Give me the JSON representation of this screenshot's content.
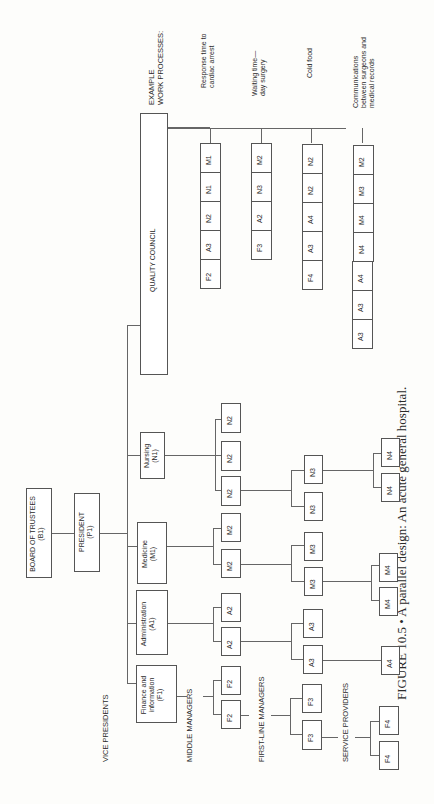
{
  "figure": {
    "caption": "FIGURE 10.5 • A parallel design: An acute general hospital.",
    "orientation": "rotated 90 degrees counter-clockwise"
  },
  "hierarchy": {
    "board": {
      "title": "BOARD OF TRUSTEES",
      "code": "(B1)"
    },
    "president": {
      "title": "PRESIDENT",
      "code": "(P1)"
    },
    "level_labels": {
      "vice_presidents": "VICE PRESIDENTS",
      "middle_managers": "MIDDLE MANAGERS",
      "first_line_managers": "FIRST-LINE MANAGERS",
      "service_providers": "SERVICE PROVIDERS"
    },
    "vps": [
      {
        "title": "Finance and\ninformation",
        "line1": "Finance and",
        "line2": "information",
        "code": "(F1)",
        "middle": [
          "F2",
          "F2"
        ],
        "first_line": [
          "F3",
          "F3"
        ],
        "service": [
          "F4",
          "F4"
        ]
      },
      {
        "title": "Administration",
        "code": "(A1)",
        "middle": [
          "A2",
          "A2"
        ],
        "first_line": [
          "A3",
          "A3"
        ],
        "service": [
          "A4"
        ]
      },
      {
        "title": "Medicine",
        "code": "(M1)",
        "middle": [
          "M2",
          "M2"
        ],
        "first_line": [
          "M3",
          "M3"
        ],
        "service": [
          "M4",
          "M4"
        ]
      },
      {
        "title": "Nursing",
        "code": "(N1)",
        "middle": [
          "N2",
          "N2",
          "N2"
        ],
        "first_line": [
          "N3",
          "N3"
        ],
        "service": [
          "N4",
          "N4"
        ]
      }
    ]
  },
  "quality_council": {
    "title": "QUALITY COUNCIL",
    "header": {
      "line1": "EXAMPLE",
      "line2": "WORK PROCESSES:"
    },
    "processes": [
      {
        "name": "Response time to cardiac arrest",
        "line1": "Response time to",
        "line2": "cardiac arrest",
        "members": [
          "F2",
          "A3",
          "N2",
          "N1",
          "M1"
        ]
      },
      {
        "name": "Waiting time—day surgery",
        "line1": "Waiting time—",
        "line2": "day surgery",
        "members": [
          "F3",
          "A2",
          "N3",
          "M2"
        ]
      },
      {
        "name": "Cold food",
        "line1": "Cold food",
        "members": [
          "F4",
          "A3",
          "A4",
          "N2",
          "N2"
        ]
      },
      {
        "name": "Communications between surgeons and medical records",
        "line1": "Communications",
        "line2": "between surgeons and",
        "line3": "medical records",
        "members": [
          "A3",
          "A3",
          "A4",
          "N4",
          "M4",
          "M3",
          "M2"
        ]
      }
    ]
  }
}
